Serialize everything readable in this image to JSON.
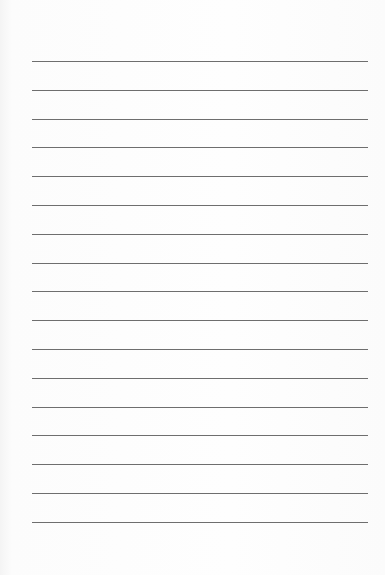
{
  "paper": {
    "type": "lined",
    "line_count": 17,
    "first_line_y": 61,
    "line_spacing": 28.8,
    "line_left": 32,
    "line_width": 336,
    "line_color": "#6e6e6e",
    "background_color": "#fdfdfd"
  }
}
